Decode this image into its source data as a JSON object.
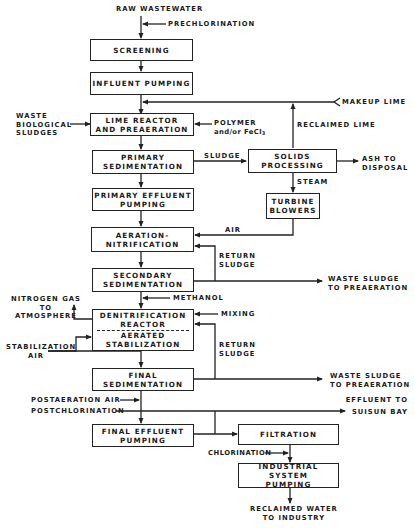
{
  "inputs": {
    "raw_wastewater": "RAW WASTEWATER",
    "prechlorination": "PRECHLORINATION",
    "waste_biological_sludges": [
      "WASTE",
      "BIOLOGICAL",
      "SLUDGES"
    ],
    "polymer": "POLYMER",
    "polymer_alt": "and/or FeCl",
    "polymer_alt_sub": "3",
    "makeup_lime": "MAKEUP LIME",
    "methanol": "METHANOL",
    "mixing": "MIXING",
    "stabilization_air": [
      "STABILIZATION",
      "AIR"
    ],
    "postaeration_air": "POSTAERATION AIR",
    "postchlorination": "POSTCHLORINATION",
    "chlorination": "CHLORINATION",
    "air": "AIR",
    "steam": "STEAM"
  },
  "boxes": {
    "screening": [
      "SCREENING"
    ],
    "influent_pumping": [
      "INFLUENT PUMPING"
    ],
    "lime_reactor": [
      "LIME REACTOR",
      "AND PREAERATION"
    ],
    "primary_sedimentation": [
      "PRIMARY",
      "SEDIMENTATION"
    ],
    "primary_effluent_pumping": [
      "PRIMARY EFFLUENT",
      "PUMPING"
    ],
    "aeration_nitrification": [
      "AERATION-",
      "NITRIFICATION"
    ],
    "secondary_sedimentation": [
      "SECONDARY",
      "SEDIMENTATION"
    ],
    "denitrification_reactor": [
      "DENITRIFICATION",
      "REACTOR"
    ],
    "aerated_stabilization": [
      "AERATED",
      "STABILIZATION"
    ],
    "final_sedimentation": [
      "FINAL",
      "SEDIMENTATION"
    ],
    "final_effluent_pumping": [
      "FINAL EFFLUENT",
      "PUMPING"
    ],
    "solids_processing": [
      "SOLIDS",
      "PROCESSING"
    ],
    "turbine_blowers": [
      "TURBINE",
      "BLOWERS"
    ],
    "filtration": [
      "FILTRATION"
    ],
    "industrial_system_pumping": [
      "INDUSTRIAL SYSTEM",
      "PUMPING"
    ]
  },
  "flows": {
    "reclaimed_lime": "RECLAIMED LIME",
    "sludge": "SLUDGE",
    "ash_to_disposal": [
      "ASH TO",
      "DISPOSAL"
    ],
    "return_sludge_1": [
      "RETURN",
      "SLUDGE"
    ],
    "return_sludge_2": [
      "RETURN",
      "SLUDGE"
    ],
    "waste_sludge_1": [
      "WASTE SLUDGE",
      "TO PREAERATION"
    ],
    "waste_sludge_2": [
      "WASTE SLUDGE",
      "TO PREAERATION"
    ],
    "nitrogen_gas": [
      "NITROGEN GAS",
      "TO",
      "ATMOSPHERE"
    ],
    "effluent_to_bay": [
      "EFFLUENT TO",
      "SUISUN BAY"
    ]
  },
  "outputs": {
    "reclaimed_water": [
      "RECLAIMED WATER",
      "TO INDUSTRY"
    ]
  }
}
